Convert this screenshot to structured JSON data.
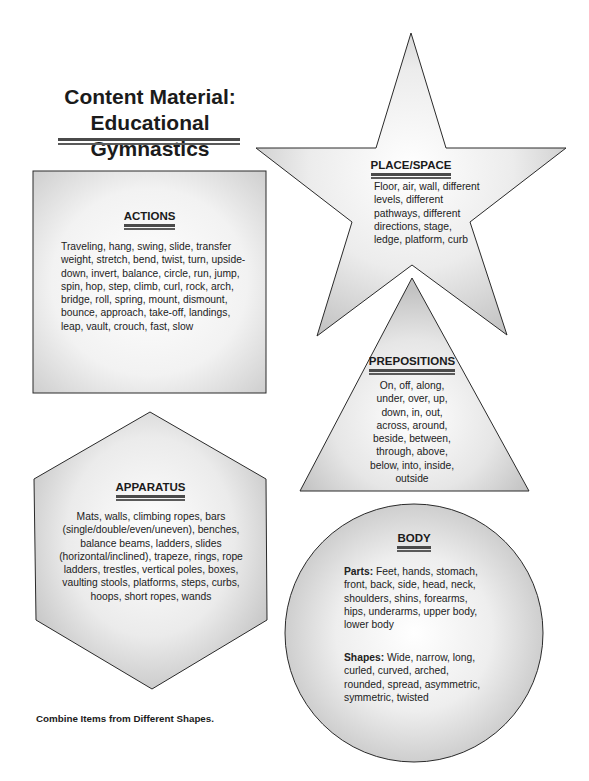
{
  "title": {
    "line1": "Content Material:",
    "line2": "Educational Gymnastics"
  },
  "actions": {
    "shape": "square",
    "heading": "ACTIONS",
    "text": "Traveling, hang, swing, slide, transfer weight, stretch, bend, twist, turn, upside-down, invert, balance, circle, run, jump, spin, hop, step, climb, curl, rock, arch, bridge, roll, spring, mount, dismount, bounce, approach, take-off, landings, leap, vault, crouch, fast, slow"
  },
  "place_space": {
    "shape": "star",
    "heading": "PLACE/SPACE",
    "text": "Floor, air, wall, different levels, different pathways, different directions, stage, ledge, platform, curb"
  },
  "prepositions": {
    "shape": "triangle",
    "heading": "PREPOSITIONS",
    "text": "On, off, along, under, over, up, down, in, out, across, around, beside, between, through, above, below, into, inside, outside"
  },
  "apparatus": {
    "shape": "hexagon",
    "heading": "APPARATUS",
    "text": "Mats, walls, climbing ropes, bars (single/double/even/uneven), benches, balance beams, ladders, slides (horizontal/inclined), trapeze, rings, rope ladders, trestles, vertical poles, boxes, vaulting stools, platforms, steps, curbs, hoops, short ropes, wands"
  },
  "body": {
    "shape": "circle",
    "heading": "BODY",
    "parts_label": "Parts:",
    "parts_text": " Feet, hands, stomach, front, back, side, head, neck, shoulders, shins, forearms, hips, underarms, upper body, lower body",
    "shapes_label": "Shapes:",
    "shapes_text": " Wide, narrow, long, curled, curved, arched, rounded, spread, asymmetric, symmetric, twisted"
  },
  "footer": {
    "note": "Combine Items from Different Shapes."
  },
  "colors": {
    "shape_fill_center": "#ffffff",
    "shape_fill_edge": "#c8c8c8",
    "outline": "#2a2a2a",
    "rule": "#4a4a4a"
  }
}
